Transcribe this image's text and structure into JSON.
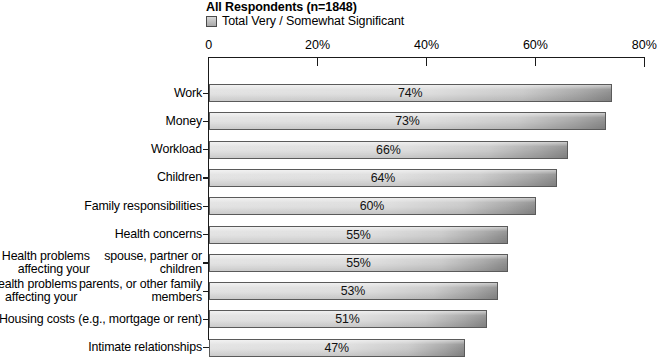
{
  "header": {
    "title": "All Respondents (n=1848)",
    "legend_label": "Total Very / Somewhat Significant"
  },
  "chart_data": {
    "type": "bar",
    "orientation": "horizontal",
    "title": "All Respondents (n=1848)",
    "xlabel": "",
    "ylabel": "",
    "xlim": [
      0,
      80
    ],
    "grid": false,
    "legend_position": "top",
    "legend": [
      "Total Very / Somewhat Significant"
    ],
    "tick_labels": [
      "0",
      "20%",
      "40%",
      "60%",
      "80%"
    ],
    "tick_values": [
      0,
      20,
      40,
      60,
      80
    ],
    "categories": [
      "Work",
      "Money",
      "Workload",
      "Children",
      "Family responsibilities",
      "Health concerns",
      "Health problems affecting your spouse, partner or children",
      "Health problems affecting your parents, or other family members",
      "Housing costs (e.g., mortgage or rent)",
      "Intimate relationships"
    ],
    "category_lines": [
      [
        "Work"
      ],
      [
        "Money"
      ],
      [
        "Workload"
      ],
      [
        "Children"
      ],
      [
        "Family responsibilities"
      ],
      [
        "Health concerns"
      ],
      [
        "Health problems affecting your",
        "spouse, partner or children"
      ],
      [
        "Health problems affecting your",
        "parents, or other family members"
      ],
      [
        "Housing costs (e.g., mortgage or rent)"
      ],
      [
        "Intimate relationships"
      ]
    ],
    "values": [
      74,
      73,
      66,
      64,
      60,
      55,
      55,
      53,
      51,
      47
    ],
    "value_labels": [
      "74%",
      "73%",
      "66%",
      "64%",
      "60%",
      "55%",
      "55%",
      "53%",
      "51%",
      "47%"
    ],
    "series": [
      {
        "name": "Total Very / Somewhat Significant",
        "values": [
          74,
          73,
          66,
          64,
          60,
          55,
          55,
          53,
          51,
          47
        ]
      }
    ],
    "colors": {
      "bar_light": "#e2e2e2",
      "bar_dark": "#8d8d8d",
      "bar_border": "#5a5a5a",
      "axis": "#1a1a1a",
      "text": "#000000",
      "background": "#ffffff"
    }
  }
}
